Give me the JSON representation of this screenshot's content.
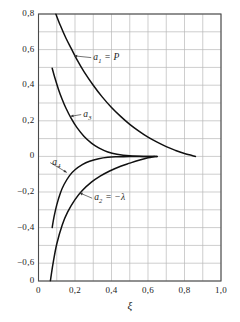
{
  "chart_data": {
    "type": "line",
    "title": "",
    "subtitle": "",
    "xlabel": "ξ",
    "ylabel": "",
    "xlim": [
      0.0,
      1.0
    ],
    "ylim": [
      -0.7,
      0.8
    ],
    "grid": true,
    "grid_color": "#b9b9b9",
    "frame_color": "#4a4a4a",
    "curve_color": "#111111",
    "legend_position": "inline-annotations",
    "x_ticks": [
      {
        "value": 0.0,
        "label": "0"
      },
      {
        "value": 0.2,
        "label": "0,2"
      },
      {
        "value": 0.4,
        "label": "0,4"
      },
      {
        "value": 0.6,
        "label": "0,6"
      },
      {
        "value": 0.8,
        "label": "0,8"
      },
      {
        "value": 1.0,
        "label": "1,0"
      }
    ],
    "x_minor_step": 0.1,
    "y_ticks": [
      {
        "value": 0.8,
        "label": "0,8"
      },
      {
        "value": 0.6,
        "label": "0,6"
      },
      {
        "value": 0.4,
        "label": "0,4"
      },
      {
        "value": 0.2,
        "label": "0,2"
      },
      {
        "value": 0.0,
        "label": "0"
      },
      {
        "value": -0.2,
        "label": "−0,2"
      },
      {
        "value": -0.4,
        "label": "−0,4"
      },
      {
        "value": -0.6,
        "label": "−0,6"
      },
      {
        "value": -0.7,
        "label": "0"
      }
    ],
    "y_minor_step": 0.1,
    "series": [
      {
        "name": "a1",
        "label": "a₁ = P",
        "label_html": "a<sub>1</sub> = P",
        "x": [
          0.095,
          0.12,
          0.15,
          0.18,
          0.21,
          0.25,
          0.3,
          0.35,
          0.4,
          0.45,
          0.5,
          0.55,
          0.6,
          0.65,
          0.7,
          0.75,
          0.8,
          0.86
        ],
        "y": [
          0.8,
          0.735,
          0.665,
          0.605,
          0.545,
          0.475,
          0.4,
          0.333,
          0.275,
          0.225,
          0.18,
          0.142,
          0.108,
          0.08,
          0.055,
          0.034,
          0.016,
          0.0
        ]
      },
      {
        "name": "a3",
        "label": "a₃",
        "label_html": "a<sub>3</sub>",
        "x": [
          0.075,
          0.09,
          0.11,
          0.13,
          0.15,
          0.18,
          0.21,
          0.25,
          0.29,
          0.33,
          0.38,
          0.43,
          0.5,
          0.58,
          0.65
        ],
        "y": [
          0.495,
          0.44,
          0.375,
          0.32,
          0.272,
          0.212,
          0.163,
          0.112,
          0.075,
          0.048,
          0.025,
          0.012,
          0.003,
          0.0,
          0.0
        ]
      },
      {
        "name": "a4",
        "label": "a₄",
        "label_html": "a<sub>4</sub>",
        "x": [
          0.075,
          0.085,
          0.1,
          0.12,
          0.14,
          0.17,
          0.2,
          0.24,
          0.28,
          0.33,
          0.38,
          0.43,
          0.5,
          0.58,
          0.65
        ],
        "y": [
          -0.4,
          -0.34,
          -0.272,
          -0.205,
          -0.158,
          -0.108,
          -0.075,
          -0.046,
          -0.027,
          -0.013,
          -0.005,
          -0.002,
          0.0,
          0.0,
          0.0
        ]
      },
      {
        "name": "a2",
        "label": "a₂ = −λ",
        "label_html": "a<sub>2</sub> = −λ",
        "x": [
          0.065,
          0.08,
          0.1,
          0.13,
          0.16,
          0.2,
          0.24,
          0.29,
          0.34,
          0.39,
          0.45,
          0.5,
          0.55,
          0.6,
          0.635
        ],
        "y": [
          -0.7,
          -0.6,
          -0.492,
          -0.385,
          -0.312,
          -0.243,
          -0.192,
          -0.145,
          -0.11,
          -0.082,
          -0.055,
          -0.038,
          -0.022,
          -0.008,
          0.0
        ]
      }
    ],
    "annotations": [
      {
        "name": "a1-annotation",
        "text": "a₁ = P",
        "x": 0.3,
        "y": 0.555,
        "points_to_x": 0.195,
        "points_to_y": 0.565
      },
      {
        "name": "a3-annotation",
        "text": "a₃",
        "x": 0.245,
        "y": 0.235,
        "points_to_x": 0.175,
        "points_to_y": 0.225
      },
      {
        "name": "a4-annotation",
        "text": "a₄",
        "x": 0.075,
        "y": -0.035,
        "points_to_x": 0.155,
        "points_to_y": -0.09
      },
      {
        "name": "a2-annotation",
        "text": "a₂ = −λ",
        "x": 0.305,
        "y": -0.235,
        "points_to_x": 0.225,
        "points_to_y": -0.205
      }
    ]
  }
}
